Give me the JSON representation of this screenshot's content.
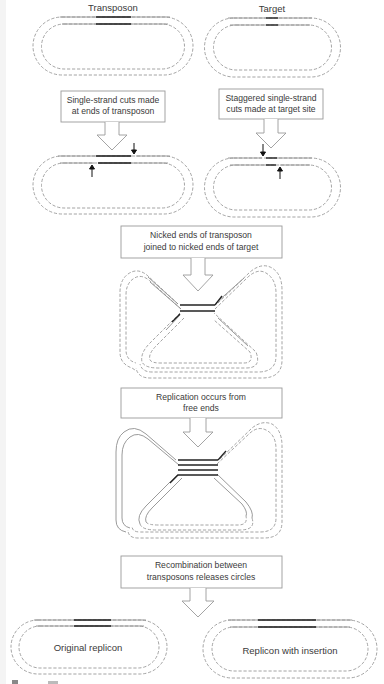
{
  "diagram": {
    "top_labels": {
      "transposon": "Transposon",
      "target": "Target"
    },
    "steps": [
      {
        "id": "step1a",
        "lines": [
          "Single-strand cuts made",
          "at ends of transposon"
        ]
      },
      {
        "id": "step1b",
        "lines": [
          "Staggered single-strand",
          "cuts made at target site"
        ]
      },
      {
        "id": "step2",
        "lines": [
          "Nicked ends of transposon",
          "joined to nicked ends of target"
        ]
      },
      {
        "id": "step3",
        "lines": [
          "Replication occurs from",
          "free ends"
        ]
      },
      {
        "id": "step4",
        "lines": [
          "Recombination between",
          "transposons releases circles"
        ]
      }
    ],
    "products": {
      "left": "Original replicon",
      "right": "Replicon with insertion"
    },
    "colors": {
      "strand": "#9a9a9a",
      "transposon_segment": "#222222",
      "box_border": "#9a9a9a",
      "text": "#3a3a3a"
    }
  }
}
